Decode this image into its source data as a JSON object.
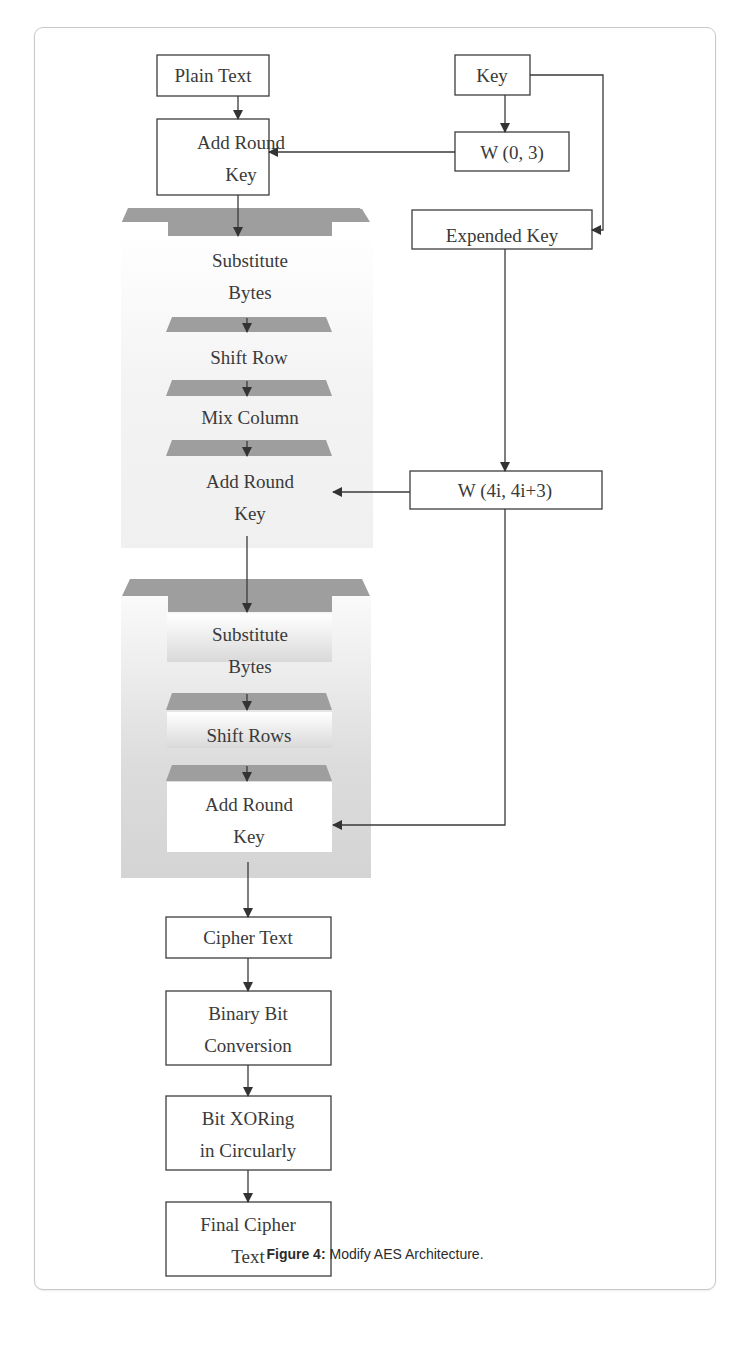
{
  "figure": {
    "caption_label": "Figure 4:",
    "caption_text": " Modify AES Architecture."
  },
  "nodes": {
    "plain_text": "Plain Text",
    "key": "Key",
    "add_round_key_1a": "Add Round",
    "add_round_key_1b": "Key",
    "w_0_3": "W (0, 3)",
    "expended_key": "Expended Key",
    "substitute_bytes_1a": "Substitute",
    "substitute_bytes_1b": "Bytes",
    "shift_row": "Shift Row",
    "mix_column": "Mix Column",
    "add_round_key_2a": "Add Round",
    "add_round_key_2b": "Key",
    "w_4i": "W (4i, 4i+3)",
    "substitute_bytes_2a": "Substitute",
    "substitute_bytes_2b": "Bytes",
    "shift_rows": "Shift Rows",
    "add_round_key_3a": "Add Round",
    "add_round_key_3b": "Key",
    "cipher_text": "Cipher Text",
    "binary_bit_a": "Binary Bit",
    "binary_bit_b": "Conversion",
    "bit_xor_a": "Bit XORing",
    "bit_xor_b": "in Circularly",
    "final_cipher_a": "Final Cipher",
    "final_cipher_b": "Text"
  },
  "colors": {
    "band": "#9e9e9e",
    "stroke": "#3d3d3d",
    "text": "#3a3a3a"
  }
}
